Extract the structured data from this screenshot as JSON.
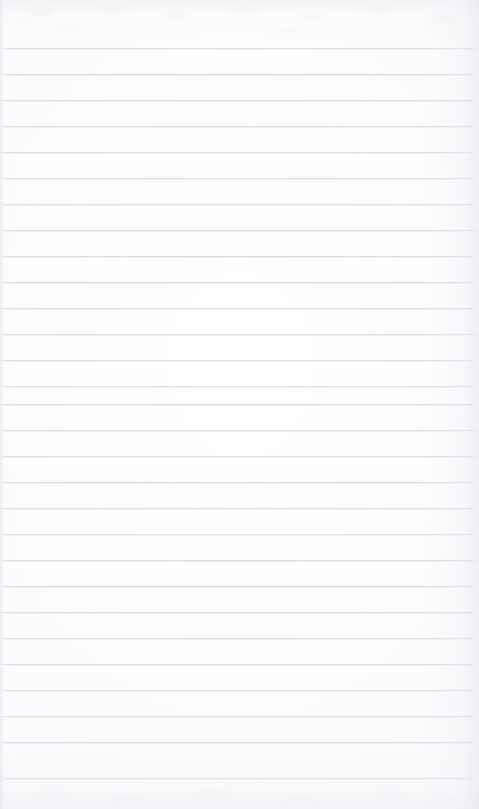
{
  "document": {
    "kind": "scanned-lined-paper",
    "title": "Blank ruled notepad page",
    "text_content": "",
    "page_width": 479,
    "page_height": 809
  },
  "paper": {
    "background_color": "#ffffff",
    "paper_tint": "#fdfdfe",
    "edge_shadow_color": "#e0e2e6",
    "grain_color": "#e6e8ec"
  },
  "ruling": {
    "line_color": "#d7d9dd",
    "line_thickness_px": 1,
    "line_spacing_px": 26,
    "first_line_y": 48,
    "left_inset_px": 2,
    "right_inset_px": 6,
    "line_count": 29,
    "margin_line": "none",
    "line_positions": [
      48,
      74,
      100,
      126,
      152,
      178,
      204,
      230,
      256,
      282,
      308,
      334,
      360,
      386,
      404,
      430,
      456,
      482,
      508,
      534,
      560,
      586,
      612,
      638,
      664,
      690,
      716,
      742,
      778
    ]
  },
  "annotations": {
    "handwriting": "none",
    "printed_text": "none",
    "holes_or_perforations": "none"
  }
}
